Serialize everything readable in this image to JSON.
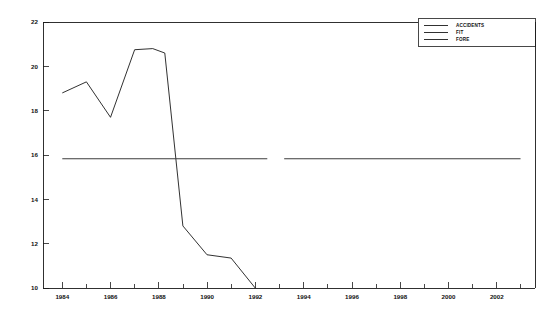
{
  "chart_data": {
    "type": "line",
    "title": "",
    "xlabel": "",
    "ylabel": "",
    "xlim": [
      1983.2,
      2003.6
    ],
    "ylim": [
      10,
      22
    ],
    "grid": false,
    "legend_position": "top-right",
    "y_ticks": [
      10,
      12,
      14,
      16,
      18,
      20,
      22
    ],
    "y_tick_labels": [
      "10",
      "12",
      "14",
      "16",
      "18",
      "20",
      "22"
    ],
    "x_ticks": [
      1984,
      1986,
      1988,
      1990,
      1992,
      1994,
      1996,
      1998,
      2000,
      2002
    ],
    "x_tick_labels": [
      "1984",
      "1986",
      "1988",
      "1990",
      "1992",
      "1994",
      "1996",
      "1998",
      "2000",
      "2002"
    ],
    "x_minor_ticks": [
      1985,
      1987,
      1989,
      1991,
      1993,
      1995,
      1997,
      1999,
      2001,
      2003
    ],
    "series": [
      {
        "name": "ACCIDENTS",
        "x": [
          1984.0,
          1985.0,
          1986.0,
          1987.0,
          1987.75,
          1988.25,
          1989.0,
          1990.0,
          1991.0,
          1992.0
        ],
        "values": [
          18.8,
          19.3,
          17.7,
          20.75,
          20.8,
          20.6,
          12.8,
          11.5,
          11.35,
          10.0
        ]
      },
      {
        "name": "FIT",
        "x": [
          1984.0,
          1992.5
        ],
        "values": [
          15.83,
          15.83
        ]
      },
      {
        "name": "FORE",
        "x": [
          1993.2,
          2003.0
        ],
        "values": [
          15.83,
          15.83
        ]
      }
    ],
    "legend_entries": [
      "ACCIDENTS",
      "FIT",
      "FORE"
    ],
    "colors": {
      "accidents": "#1a1a1a",
      "fit": "#3c3c3c",
      "fore": "#3c3c3c",
      "axis": "#1a1a1a",
      "background": "#ffffff"
    }
  },
  "legend": {
    "items": [
      {
        "label": "ACCIDENTS"
      },
      {
        "label": "FIT"
      },
      {
        "label": "FORE"
      }
    ]
  },
  "axes": {
    "y_labels": [
      "22",
      "20",
      "18",
      "16",
      "14",
      "12",
      "10"
    ],
    "x_labels": [
      "1984",
      "1986",
      "1988",
      "1990",
      "1992",
      "1994",
      "1996",
      "1998",
      "2000",
      "2002"
    ]
  }
}
